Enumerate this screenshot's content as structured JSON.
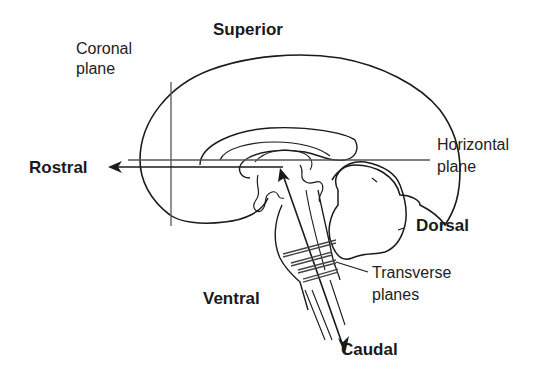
{
  "figure": {
    "labels": {
      "superior": "Superior",
      "coronal_plane_line1": "Coronal",
      "coronal_plane_line2": "plane",
      "rostral": "Rostral",
      "horizontal_plane_line1": "Horizontal",
      "horizontal_plane_line2": "plane",
      "dorsal": "Dorsal",
      "transverse_planes_line1": "Transverse",
      "transverse_planes_line2": "planes",
      "ventral": "Ventral",
      "caudal": "Caudal"
    },
    "colors": {
      "outline": "#1a1a1a",
      "plane_lines": "#555555",
      "background": "#ffffff"
    }
  }
}
